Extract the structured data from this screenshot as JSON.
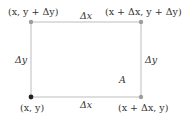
{
  "diagram": {
    "corners": {
      "top_left": "(x, y + Δy)",
      "top_right": "(x + Δx, y + Δy)",
      "bottom_left": "(x, y)",
      "bottom_right": "(x + Δx, y)"
    },
    "sides": {
      "top": "Δx",
      "bottom": "Δx",
      "left": "Δy",
      "right": "Δy"
    },
    "area_label": "A",
    "colors": {
      "edge": "#bdbdbd",
      "dot_gray": "#9e9e9e",
      "dot_dark": "#222222"
    }
  }
}
